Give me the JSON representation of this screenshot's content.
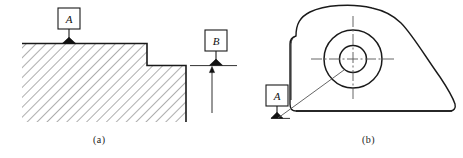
{
  "figure": {
    "type": "engineering-drawing",
    "line_color": "#1a1a1a",
    "hatch_color": "#4a4a4a",
    "background": "#ffffff"
  },
  "sub_figures": [
    {
      "id": "a",
      "caption": "(a)",
      "view": "stepped-block-section",
      "datums": [
        {
          "letter": "A",
          "attached_to": "top-surface"
        },
        {
          "letter": "B",
          "attached_to": "right-extension-line"
        }
      ]
    },
    {
      "id": "b",
      "caption": "(b)",
      "view": "cam-lobe-plan",
      "datums": [
        {
          "letter": "A",
          "attached_to": "bore-axis"
        }
      ]
    }
  ],
  "labels": {
    "datum_a_left": "A",
    "datum_b_left": "B",
    "datum_a_right": "A",
    "caption_a": "(a)",
    "caption_b": "(b)"
  }
}
